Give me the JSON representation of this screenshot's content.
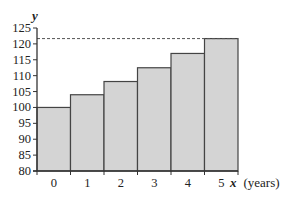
{
  "chart_data": {
    "type": "bar",
    "title": "",
    "xlabel": "x (years)",
    "xlabel_var": "x",
    "xlabel_unit": "(years)",
    "ylabel": "y",
    "categories": [
      "0",
      "1",
      "2",
      "3",
      "4",
      "5"
    ],
    "values": [
      100,
      104,
      108.16,
      112.49,
      116.99,
      121.67
    ],
    "ylim": [
      80,
      125
    ],
    "yticks": [
      80,
      85,
      90,
      95,
      100,
      105,
      110,
      115,
      120,
      125
    ],
    "reference_line": {
      "y": 121.67,
      "style": "dashed"
    },
    "grid": false,
    "legend": null,
    "colors": {
      "bar_fill": "#d4d4d4",
      "bar_stroke": "#444444",
      "axis": "#333333"
    }
  }
}
